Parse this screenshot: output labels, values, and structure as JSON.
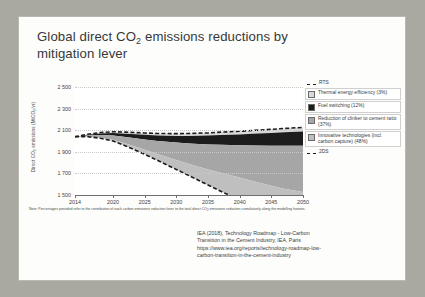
{
  "slide": {
    "title_line1": "Global direct CO",
    "title_sub": "2",
    "title_line1b": " emissions reductions by",
    "title_line2": "mitigation lever"
  },
  "chart_data": {
    "type": "area",
    "title": "Global direct CO2 emissions reductions by mitigation lever",
    "xlabel": "",
    "ylabel": "Direct CO2 emissions (MtCO2/yr)",
    "ylabel_display": "Direct CO",
    "ylabel_sub": "2",
    "ylabel_rest": " emissions (MtCO",
    "ylabel_sub2": "2",
    "ylabel_end": "/yr)",
    "xlim": [
      2014,
      2050
    ],
    "ylim": [
      1500,
      2500
    ],
    "grid": true,
    "legend_position": "right",
    "yticks": [
      "2 500",
      "2 300",
      "2 100",
      "1 900",
      "1 700",
      "1 500"
    ],
    "ytick_values": [
      2500,
      2300,
      2100,
      1900,
      1700,
      1500
    ],
    "xticks": [
      "2014",
      "2020",
      "2025",
      "2030",
      "2035",
      "2040",
      "2045",
      "2050"
    ],
    "xtick_values": [
      2014,
      2020,
      2025,
      2030,
      2035,
      2040,
      2045,
      2050
    ],
    "x": [
      2014,
      2016,
      2018,
      2020,
      2022,
      2025,
      2027,
      2030,
      2032,
      2035,
      2037,
      2040,
      2042,
      2045,
      2047,
      2050
    ],
    "series": [
      {
        "name": "RTS",
        "type": "line",
        "style": "dashed",
        "color": "#1c1c1c",
        "values": [
          2040,
          2062,
          2078,
          2086,
          2082,
          2074,
          2070,
          2068,
          2070,
          2075,
          2082,
          2090,
          2098,
          2108,
          2116,
          2126
        ]
      },
      {
        "name": "Thermal energy efficiency (3%)",
        "type": "area",
        "color": "#d9d9d9",
        "values": [
          0,
          4,
          8,
          12,
          14,
          17,
          19,
          21,
          23,
          25,
          27,
          29,
          31,
          33,
          35,
          37
        ]
      },
      {
        "name": "Fuel switching (12%)",
        "type": "area",
        "color": "#1c1c1c",
        "values": [
          0,
          6,
          14,
          22,
          30,
          42,
          50,
          62,
          70,
          82,
          90,
          100,
          108,
          118,
          124,
          132
        ]
      },
      {
        "name": "Reduction of clinker to cement ratio (37%)",
        "type": "area",
        "color": "#a6a6a6",
        "values": [
          0,
          10,
          24,
          40,
          62,
          96,
          122,
          162,
          190,
          232,
          260,
          300,
          330,
          372,
          398,
          430
        ]
      },
      {
        "name": "Innovative technologies (incl. carbon capture) (48%)",
        "type": "area",
        "color": "#bfbfbf",
        "values": [
          0,
          2,
          6,
          12,
          22,
          42,
          58,
          86,
          108,
          144,
          170,
          208,
          238,
          284,
          314,
          360
        ]
      },
      {
        "name": "2DS",
        "type": "line",
        "style": "dashed",
        "color": "#1c1c1c",
        "values": [
          2040,
          2040,
          2026,
          2000,
          1954,
          1877,
          1821,
          1737,
          1679,
          1592,
          1535,
          1453,
          1391,
          1301,
          1245,
          1167
        ]
      }
    ],
    "legend": [
      {
        "label": "RTS",
        "marker": "dashed-line",
        "color": "#1c1c1c",
        "boxed": false
      },
      {
        "label": "Thermal energy efficiency (3%)",
        "marker": "swatch",
        "color": "#d9d9d9",
        "boxed": true
      },
      {
        "label": "Fuel switching (12%)",
        "marker": "swatch",
        "color": "#1c1c1c",
        "boxed": true
      },
      {
        "label": "Reduction of clinker to cement ratio (37%)",
        "marker": "swatch",
        "color": "#a6a6a6",
        "boxed": true
      },
      {
        "label": "Innovative technologies (incl. carbon capture) (48%)",
        "marker": "swatch",
        "color": "#bfbfbf",
        "boxed": true
      },
      {
        "label": "2DS",
        "marker": "dashed-line",
        "color": "#1c1c1c",
        "boxed": false
      }
    ]
  },
  "note": {
    "prefix": "Note: Percentages provided refer to the contribution of each carbon emissions reduction lever to the total direct CO",
    "sub": "2",
    "suffix": " emissions reduction cumulatively along the modelling horizon."
  },
  "source": {
    "line1": "IEA (2018), Technology Roadmap - Low-Carbon",
    "line2": "Transition in the Cement Industry, IEA, Paris",
    "line3": "https://www.iea.org/reports/technology-roadmap-low-",
    "line4": "carbon-transition-in-the-cement-industry"
  }
}
